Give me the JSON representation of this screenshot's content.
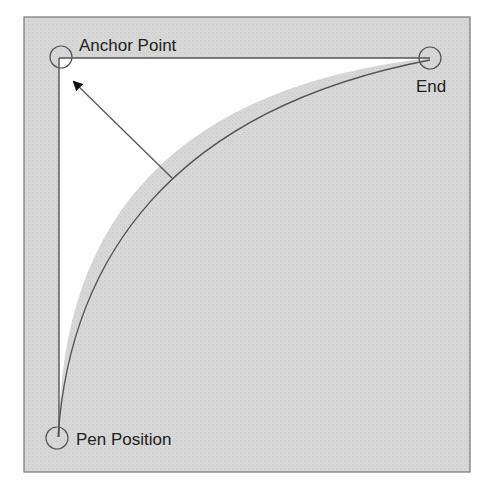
{
  "diagram": {
    "type": "quadratic-bezier-curve-illustration",
    "labels": {
      "anchor": "Anchor Point",
      "end": "End",
      "pen": "Pen Position"
    },
    "points": {
      "anchor": {
        "x": 61,
        "y": 57
      },
      "end": {
        "x": 430,
        "y": 58
      },
      "pen": {
        "x": 57,
        "y": 437
      }
    },
    "colors": {
      "background": "#d4d4d4",
      "inner_region": "#ffffff",
      "stroke": "#555555",
      "text": "#222222",
      "border": "#777777"
    }
  }
}
